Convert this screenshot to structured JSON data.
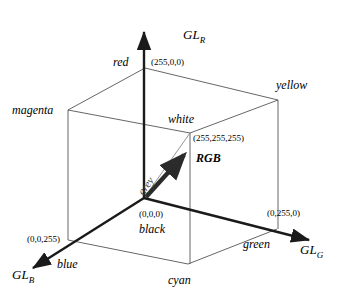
{
  "figure": {
    "background": "#ffffff",
    "stroke_color": "#1a1a1a",
    "thin_stroke_color": "#555555",
    "grey_line_color": "#888888",
    "vector_color": "#2b2b2b"
  },
  "axes": [
    {
      "id": "axis-r",
      "label_base": "GL",
      "label_sub": "R",
      "direction": "up"
    },
    {
      "id": "axis-g",
      "label_base": "GL",
      "label_sub": "G",
      "direction": "right-down"
    },
    {
      "id": "axis-b",
      "label_base": "GL",
      "label_sub": "B",
      "direction": "left-down"
    }
  ],
  "vertices": [
    {
      "id": "black",
      "name": "black",
      "coord": "(0,0,0)",
      "x": 144,
      "y": 198
    },
    {
      "id": "red",
      "name": "red",
      "coord": "(255,0,0)",
      "x": 145,
      "y": 68
    },
    {
      "id": "green",
      "name": "green",
      "coord": "(0,255,0)",
      "x": 277,
      "y": 229
    },
    {
      "id": "blue",
      "name": "blue",
      "coord": "(0,0,255)",
      "x": 68,
      "y": 240
    },
    {
      "id": "white",
      "name": "white",
      "coord": "(255,255,255)",
      "x": 190,
      "y": 133
    },
    {
      "id": "yellow",
      "name": "yellow",
      "coord": "",
      "x": 278,
      "y": 100
    },
    {
      "id": "magenta",
      "name": "magenta",
      "coord": "",
      "x": 68,
      "y": 110
    },
    {
      "id": "cyan",
      "name": "cyan",
      "coord": "",
      "x": 188,
      "y": 264
    }
  ],
  "annotations": {
    "grey_line_label": "grey",
    "vector_label": "RGB"
  },
  "labels": {
    "red": "red",
    "red_coord": "(255,0,0)",
    "yellow": "yellow",
    "magenta": "magenta",
    "white": "white",
    "white_coord": "(255,255,255)",
    "grey": "grey",
    "rgb": "RGB",
    "black_coord": "(0,0,0)",
    "black": "black",
    "blue_coord": "(0,0,255)",
    "blue": "blue",
    "cyan": "cyan",
    "green": "green",
    "green_coord": "(0,255,0)",
    "gl": "GL",
    "sub_r": "R",
    "sub_g": "G",
    "sub_b": "B"
  }
}
